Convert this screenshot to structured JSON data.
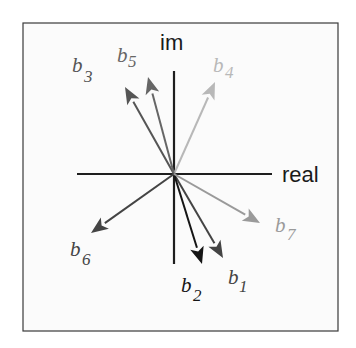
{
  "diagram": {
    "axes": {
      "horizontal_label": "real",
      "vertical_label": "im",
      "origin": [
        174,
        174
      ],
      "h_start": [
        77,
        174
      ],
      "h_end": [
        272,
        174
      ],
      "v_start": [
        174,
        71
      ],
      "v_end": [
        174,
        264
      ],
      "color": "#1e1e1e"
    },
    "frame": {
      "x": 23,
      "y": 23,
      "width": 315,
      "height": 308,
      "border": "#3a3a3a",
      "fill": "#fbfbfb"
    },
    "vectors": [
      {
        "id": "b1",
        "base": "b",
        "sub": "1",
        "tip": [
          223,
          258
        ],
        "color": "#444444",
        "label_pos": [
          228,
          284
        ],
        "sub_pos": [
          239,
          292
        ]
      },
      {
        "id": "b2",
        "base": "b",
        "sub": "2",
        "tip": [
          202,
          264
        ],
        "color": "#151515",
        "label_pos": [
          181,
          292
        ],
        "sub_pos": [
          193,
          301
        ]
      },
      {
        "id": "b3",
        "base": "b",
        "sub": "3",
        "tip": [
          125,
          87
        ],
        "color": "#555555",
        "label_pos": [
          72,
          72
        ],
        "sub_pos": [
          84,
          82
        ]
      },
      {
        "id": "b4",
        "base": "b",
        "sub": "4",
        "tip": [
          215,
          82
        ],
        "color": "#b8b8b8",
        "label_pos": [
          213,
          72
        ],
        "sub_pos": [
          225,
          78
        ]
      },
      {
        "id": "b5",
        "base": "b",
        "sub": "5",
        "tip": [
          148,
          77
        ],
        "color": "#666666",
        "label_pos": [
          117,
          62
        ],
        "sub_pos": [
          128,
          67
        ]
      },
      {
        "id": "b6",
        "base": "b",
        "sub": "6",
        "tip": [
          91,
          233
        ],
        "color": "#444444",
        "label_pos": [
          70,
          256
        ],
        "sub_pos": [
          82,
          265
        ]
      },
      {
        "id": "b7",
        "base": "b",
        "sub": "7",
        "tip": [
          260,
          223
        ],
        "color": "#9a9a9a",
        "label_pos": [
          275,
          232
        ],
        "sub_pos": [
          287,
          240
        ]
      }
    ]
  }
}
